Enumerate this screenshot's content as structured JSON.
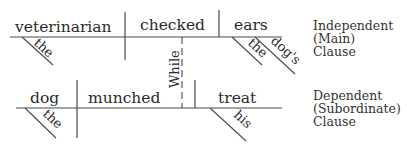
{
  "independent_clause": {
    "subject": "veterinarian",
    "subject_modifiers": [
      "the"
    ],
    "verb": "checked",
    "direct_object": "ears",
    "object_modifiers": [
      "the",
      "dog's"
    ],
    "label_lines": [
      "Independent",
      "(Main)",
      "Clause"
    ]
  },
  "connector": {
    "conjunction": "While"
  },
  "dependent_clause": {
    "subject": "dog",
    "subject_modifiers": [
      "the"
    ],
    "verb": "munched",
    "direct_object": "treat",
    "object_modifiers": [
      "his"
    ],
    "label_lines": [
      "Dependent",
      "(Subordinate)",
      "Clause"
    ]
  },
  "colors": {
    "line": "#4a4a4a",
    "text": "#2a2a2a",
    "background": "#ffffff"
  }
}
